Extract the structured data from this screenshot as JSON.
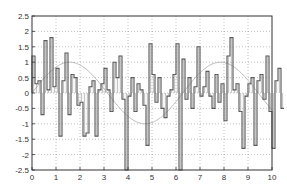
{
  "chart_data": {
    "type": "line",
    "subtype": "stairs",
    "title": "",
    "xlabel": "",
    "ylabel": "",
    "xlim": [
      0,
      10
    ],
    "ylim": [
      -2.5,
      2.5
    ],
    "grid": true,
    "legend": null,
    "x_ticks": [
      "0",
      "1",
      "2",
      "3",
      "4",
      "5",
      "6",
      "7",
      "8",
      "9",
      "10"
    ],
    "y_ticks": [
      "2.5",
      "2",
      "1.5",
      "1",
      "0.5",
      "0",
      "-0.5",
      "-1",
      "-1.5",
      "-2",
      "-2.5"
    ],
    "x_step": 0.125,
    "series": [
      {
        "name": "random stairs",
        "color": "#555555",
        "values": [
          1.2,
          0.3,
          0.4,
          -0.7,
          1.7,
          0.1,
          1.8,
          0.2,
          0.8,
          -1.4,
          0.4,
          1.3,
          -0.7,
          0.6,
          0.5,
          -0.4,
          -0.3,
          -1.4,
          -1.3,
          0.2,
          0.4,
          -1.4,
          0.1,
          0.3,
          0.8,
          0.1,
          -0.6,
          1.0,
          0.5,
          1.2,
          -0.2,
          -2.5,
          -0.1,
          0.5,
          -0.6,
          0.3,
          0.1,
          -0.4,
          -1.7,
          1.6,
          0.6,
          -0.3,
          0.5,
          -0.5,
          -0.8,
          -0.1,
          0.1,
          0.6,
          1.6,
          -2.5,
          1.1,
          -0.2,
          0.5,
          -0.5,
          0.2,
          1.5,
          -0.1,
          0.2,
          0.7,
          -0.1,
          -0.5,
          0.6,
          -0.3,
          0.3,
          -0.9,
          1.2,
          1.8,
          0.1,
          0.3,
          -0.6,
          -1.8,
          -0.1,
          0.3,
          0.5,
          -1.7,
          0.4,
          0.6,
          -0.2,
          1.2,
          -0.6,
          -1.8,
          0.4,
          0.8,
          -0.5
        ]
      },
      {
        "name": "sin(x)",
        "color": "#bbbbbb",
        "function": "sin(x)"
      }
    ]
  }
}
